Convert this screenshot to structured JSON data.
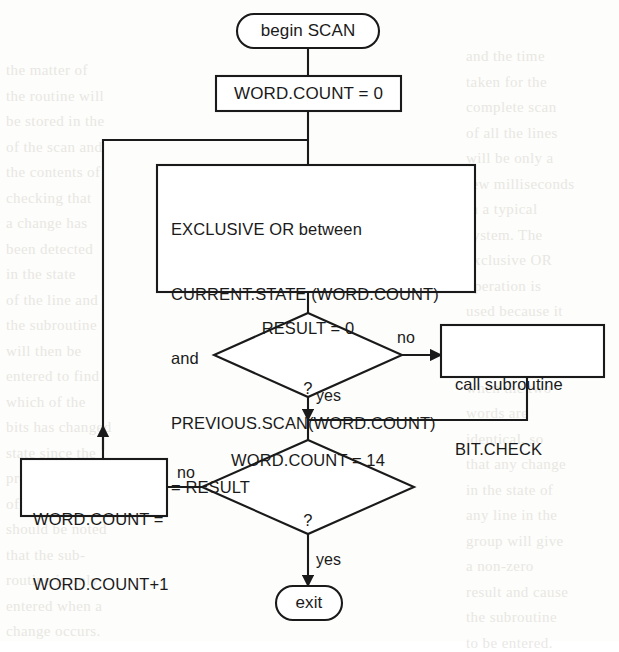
{
  "diagram": {
    "stroke_color": "#1a1a1a",
    "background_color": "#fdfdfb",
    "nodes": [
      {
        "id": "begin",
        "type": "terminal",
        "label": "begin SCAN"
      },
      {
        "id": "init",
        "type": "process",
        "label": "WORD.COUNT = 0"
      },
      {
        "id": "xor",
        "type": "process",
        "lines": [
          "EXCLUSIVE OR between",
          "CURRENT.STATE (WORD.COUNT)",
          "and",
          "PREVIOUS.SCAN(WORD.COUNT)",
          "= RESULT"
        ]
      },
      {
        "id": "result-check",
        "type": "decision",
        "label": "RESULT = 0",
        "query": "?"
      },
      {
        "id": "bit-check",
        "type": "process",
        "lines": [
          "call subroutine",
          "BIT.CHECK"
        ]
      },
      {
        "id": "count-check",
        "type": "decision",
        "label": "WORD.COUNT = 14",
        "query": "?"
      },
      {
        "id": "increment",
        "type": "process",
        "lines": [
          "WORD.COUNT =",
          "WORD.COUNT+1"
        ]
      },
      {
        "id": "exit",
        "type": "terminal",
        "label": "exit"
      }
    ],
    "edge_labels": {
      "result_no": "no",
      "result_yes": "yes",
      "count_no": "no",
      "count_yes": "yes"
    }
  },
  "page_bleed": {
    "left_column": "the matter of\nthe routine will\nbe stored in the\nof the scan and\nthe contents of\nchecking that\na change has\nbeen detected\nin the state\nof the line and\nthe subroutine\nwill then be\nentered to find\nwhich of the\nbits has changed\nstate since the\nprevious scan\nof the word. It\nshould be noted\nthat the sub-\nroutine is only\nentered when a\nchange occurs.",
    "right_column": "and the time\ntaken for the\ncomplete scan\nof all the lines\nwill be only a\nfew milliseconds\nin a typical\nsystem. The\nexclusive OR\noperation is\nused because it\ngives a result\nof zero only\nwhen the two\nwords are\nidentical, so\nthat any change\nin the state of\nany line in the\ngroup will give\na non-zero\nresult and cause\nthe subroutine\nto be entered."
  }
}
